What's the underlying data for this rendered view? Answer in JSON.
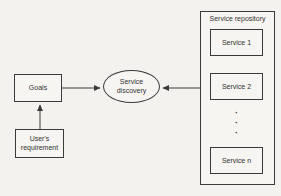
{
  "figure": {
    "colors": {
      "background": "#f4f2ef",
      "line": "#3a3a3a",
      "text": "#333333"
    }
  },
  "nodes": {
    "goals": {
      "label": "Goals"
    },
    "user_requirement": {
      "label": "User's\nrequirement"
    },
    "service_discovery": {
      "label": "Service\ndiscovery"
    }
  },
  "repository": {
    "title": "Service repository",
    "services": [
      {
        "label": "Service 1"
      },
      {
        "label": "Service 2"
      },
      {
        "label": "Service n"
      }
    ],
    "ellipsis": "·\n·\n·"
  },
  "edges": [
    {
      "from": "goals",
      "to": "service_discovery",
      "arrow_at": "service_discovery"
    },
    {
      "from": "service_repository",
      "to": "service_discovery",
      "arrow_at": "service_discovery"
    },
    {
      "from": "user_requirement",
      "to": "goals",
      "arrow_at": "goals"
    }
  ]
}
